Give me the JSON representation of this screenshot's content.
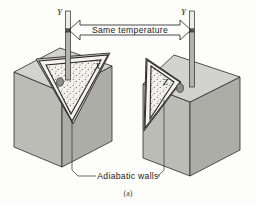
{
  "figure": {
    "caption": "(a)",
    "annotation_top": "Same temperature",
    "annotation_bottom": "Adiabatic walls",
    "thermometer_left_label": "Y",
    "thermometer_right_label": "Y",
    "system_left_label": "X",
    "system_right_label": "Z",
    "colors": {
      "block_top": "#cfcfcb",
      "block_front_left": "#b9b9b4",
      "block_front_right": "#a9a9a4",
      "slant_face": "#c4c4bf",
      "outline": "#2a2a2a",
      "stipple_bg": "#f2f1ec",
      "stipple_dot": "#6e6e68",
      "frame": "#f4f3ef",
      "thermometer_stem": "#b3b3ae",
      "thermometer_bulb": "#8f8f8a",
      "background": "#fdfdfc"
    }
  }
}
